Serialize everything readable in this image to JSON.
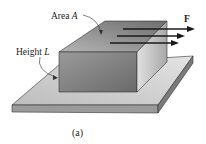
{
  "diagram": {
    "labels": {
      "area": "Area ",
      "area_var": "A",
      "height": "Height ",
      "height_var": "L",
      "force": "F"
    },
    "caption": "(a)",
    "colors": {
      "plate_top": "#c9c9c9",
      "plate_front": "#8f8f8f",
      "block_front": "#7e7e7e",
      "block_top": "#9a9a9a",
      "block_side": "#c4c4c4",
      "arrow": "#1a1a1a"
    },
    "arrows_count": 3
  }
}
